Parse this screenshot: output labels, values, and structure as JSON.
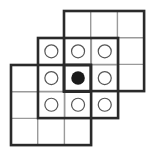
{
  "diagram": {
    "cell_size": 26.7,
    "colors": {
      "thick_line": "#2a2a2a",
      "thin_line": "#9a9a9a",
      "circle_stroke": "#555555",
      "filled_circle": "#1a1a1a",
      "background": "#ffffff"
    },
    "grids": [
      {
        "name": "upper-right-grid",
        "x": 64,
        "y": 11,
        "cols": 3,
        "rows": 3
      },
      {
        "name": "middle-grid",
        "x": 38,
        "y": 38,
        "cols": 3,
        "rows": 3
      },
      {
        "name": "lower-left-grid",
        "x": 11,
        "y": 65,
        "cols": 3,
        "rows": 3
      }
    ],
    "center_cell": {
      "x": 64,
      "y": 65
    },
    "circles": [
      {
        "row": 0,
        "col": 0,
        "filled": false
      },
      {
        "row": 0,
        "col": 1,
        "filled": false
      },
      {
        "row": 0,
        "col": 2,
        "filled": false
      },
      {
        "row": 1,
        "col": 0,
        "filled": false
      },
      {
        "row": 1,
        "col": 1,
        "filled": true
      },
      {
        "row": 1,
        "col": 2,
        "filled": false
      },
      {
        "row": 2,
        "col": 0,
        "filled": false
      },
      {
        "row": 2,
        "col": 1,
        "filled": false
      },
      {
        "row": 2,
        "col": 2,
        "filled": false
      }
    ]
  }
}
